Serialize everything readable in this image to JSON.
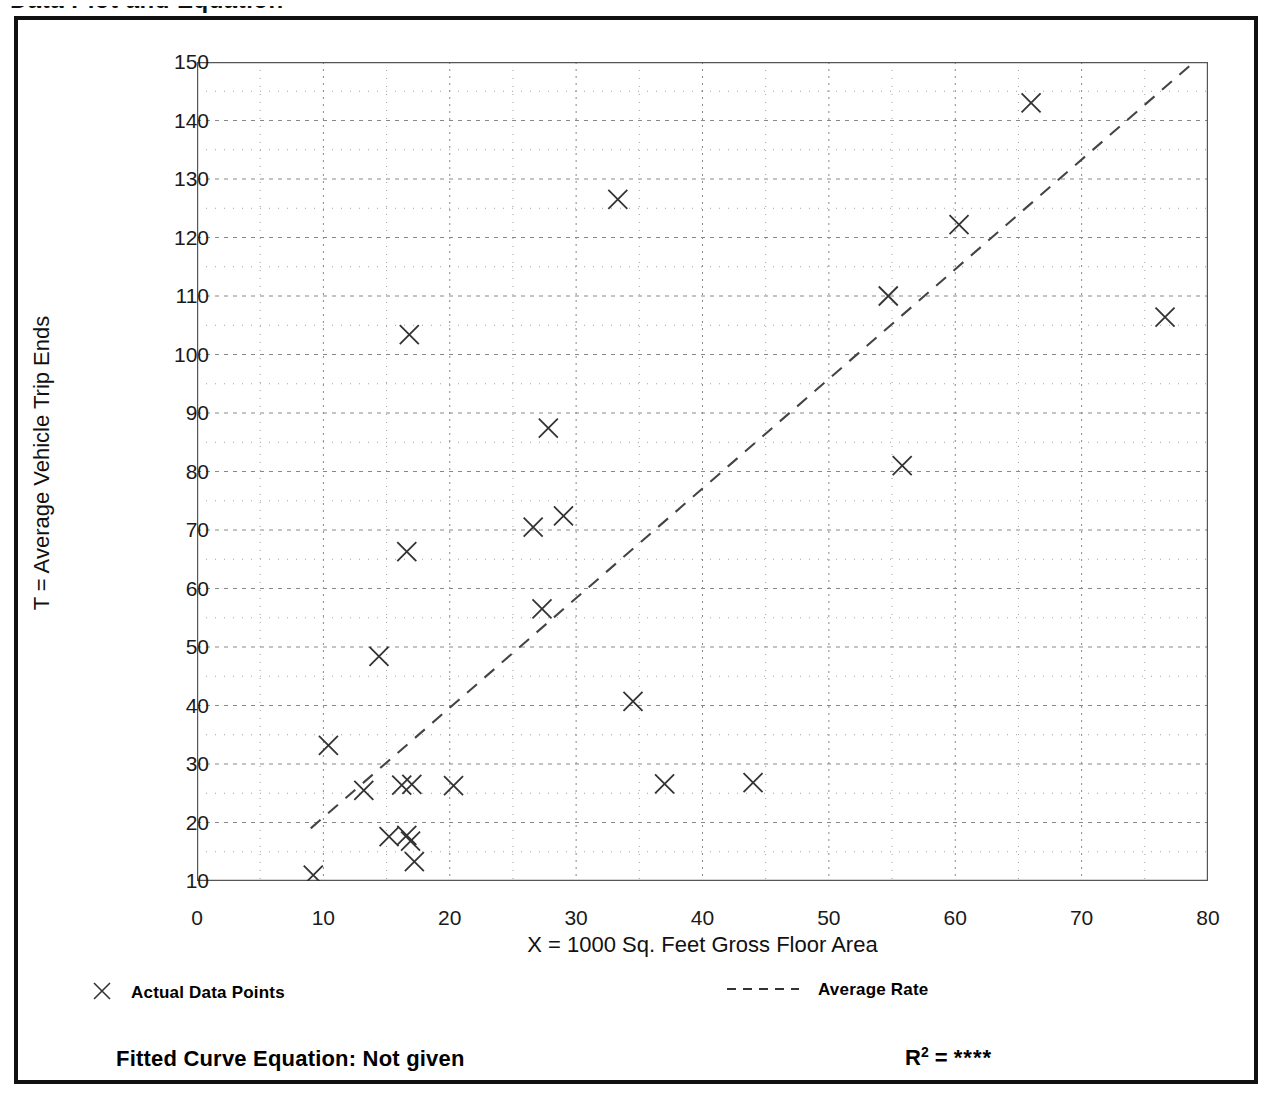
{
  "clipped_heading": "Data Plot and Equation",
  "chart_data": {
    "type": "scatter",
    "title": "",
    "xlabel": "X = 1000 Sq. Feet Gross Floor Area",
    "ylabel": "T = Average Vehicle Trip Ends",
    "xlim": [
      0,
      80
    ],
    "ylim": [
      10,
      150
    ],
    "xticks": [
      0,
      10,
      20,
      30,
      40,
      50,
      60,
      70,
      80
    ],
    "yticks": [
      10,
      20,
      30,
      40,
      50,
      60,
      70,
      80,
      90,
      100,
      110,
      120,
      130,
      140,
      150
    ],
    "x_minor_step": 5,
    "y_minor_step": 5,
    "grid": true,
    "grid_style": "dotted",
    "legend_position": "below-plot",
    "series": [
      {
        "name": "Actual Data Points",
        "marker": "x",
        "points": [
          [
            9.2,
            11.0
          ],
          [
            10.4,
            33.2
          ],
          [
            13.2,
            25.5
          ],
          [
            14.4,
            48.4
          ],
          [
            15.2,
            17.6
          ],
          [
            16.2,
            26.4
          ],
          [
            16.6,
            17.8
          ],
          [
            16.9,
            16.8
          ],
          [
            17.0,
            26.5
          ],
          [
            17.2,
            13.3
          ],
          [
            16.6,
            66.3
          ],
          [
            16.8,
            103.4
          ],
          [
            20.3,
            26.3
          ],
          [
            26.6,
            70.5
          ],
          [
            27.3,
            56.5
          ],
          [
            27.8,
            87.4
          ],
          [
            29.0,
            72.4
          ],
          [
            33.3,
            126.5
          ],
          [
            34.5,
            40.7
          ],
          [
            37.0,
            26.6
          ],
          [
            44.0,
            26.8
          ],
          [
            54.7,
            110.0
          ],
          [
            55.8,
            81.0
          ],
          [
            60.3,
            122.2
          ],
          [
            66.0,
            143.0
          ],
          [
            76.6,
            106.4
          ]
        ]
      },
      {
        "name": "Average Rate",
        "style": "dashed-line",
        "endpoints": [
          [
            9.0,
            19.0
          ],
          [
            78.9,
            150.0
          ]
        ]
      }
    ]
  },
  "legend": {
    "left_marker_icon": "x-marker-icon",
    "left_label": "Actual Data Points",
    "right_line_icon": "dashed-line-icon",
    "right_label": "Average Rate"
  },
  "footer": {
    "equation_text": "Fitted Curve Equation:  Not given",
    "r_squared_prefix": "R",
    "r_squared_exponent": "2",
    "r_squared_equals": " = ",
    "r_squared_value": "****"
  }
}
